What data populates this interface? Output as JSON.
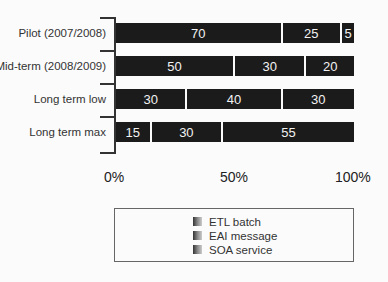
{
  "chart_data": {
    "type": "bar",
    "orientation": "horizontal",
    "stacked": true,
    "normalized": true,
    "title": "",
    "xlabel": "",
    "ylabel": "",
    "xlim": [
      0,
      100
    ],
    "x_tick_labels": [
      "0%",
      "50%",
      "100%"
    ],
    "grid": false,
    "legend_position": "bottom",
    "categories": [
      "Pilot (2007/2008)",
      "Mid-term (2008/2009)",
      "Long term low",
      "Long term max"
    ],
    "series": [
      {
        "name": "ETL batch",
        "values": [
          70,
          50,
          30,
          15
        ]
      },
      {
        "name": "EAI message",
        "values": [
          25,
          30,
          40,
          30
        ]
      },
      {
        "name": "SOA service",
        "values": [
          5,
          20,
          30,
          55
        ]
      }
    ]
  },
  "rows": [
    {
      "label": "Pilot (2007/2008)",
      "segments": [
        {
          "v": 70,
          "t": "70"
        },
        {
          "v": 25,
          "t": "25"
        },
        {
          "v": 5,
          "t": "5"
        }
      ]
    },
    {
      "label": "Mid-term (2008/2009)",
      "segments": [
        {
          "v": 50,
          "t": "50"
        },
        {
          "v": 30,
          "t": "30"
        },
        {
          "v": 20,
          "t": "20"
        }
      ]
    },
    {
      "label": "Long term low",
      "segments": [
        {
          "v": 30,
          "t": "30"
        },
        {
          "v": 40,
          "t": "40"
        },
        {
          "v": 30,
          "t": "30"
        }
      ]
    },
    {
      "label": "Long term max",
      "segments": [
        {
          "v": 15,
          "t": "15"
        },
        {
          "v": 30,
          "t": "30"
        },
        {
          "v": 55,
          "t": "55"
        }
      ]
    }
  ],
  "axis": {
    "ticks": [
      "0%",
      "50%",
      "100%"
    ]
  },
  "legend": {
    "items": [
      "ETL batch",
      "EAI message",
      "SOA service"
    ]
  }
}
